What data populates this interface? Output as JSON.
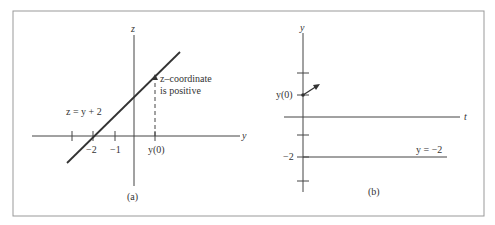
{
  "panel_a": {
    "caption": "(a)",
    "vertical_axis_label": "z",
    "horizontal_axis_label": "y",
    "line_equation": "z = y + 2",
    "tick_labels": [
      "−2",
      "−1",
      "y(0)"
    ],
    "annotation_line1": "z–coordinate",
    "annotation_line2": "is positive"
  },
  "panel_b": {
    "caption": "(b)",
    "vertical_axis_label": "y",
    "horizontal_axis_label": "t",
    "initial_value_label": "y(0)",
    "equilibrium_tick_label": "−2",
    "equilibrium_equation": "y = −2"
  },
  "colors": {
    "ink": "#333333",
    "frame": "#999999"
  }
}
